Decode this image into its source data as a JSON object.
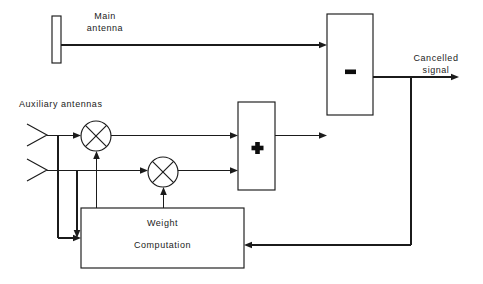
{
  "diagram": {
    "stroke_color": "#1b1b1b",
    "background_color": "#ffffff",
    "labels": {
      "main_antenna_line1": "Main",
      "main_antenna_line2": "antenna",
      "auxiliary_antennas": "Auxiliary antennas",
      "cancelled_signal_line1": "Cancelled",
      "cancelled_signal_line2": "signal",
      "weight_line1": "Weight",
      "weight_line2": "Computation"
    },
    "blocks": [
      {
        "id": "main-antenna",
        "name": "main-antenna-element",
        "shape": "rect",
        "x": 52,
        "y": 16,
        "width": 9,
        "height": 47,
        "symbol": ""
      },
      {
        "id": "subtractor",
        "name": "subtractor-block",
        "shape": "rect",
        "x": 327,
        "y": 14,
        "width": 46,
        "height": 101,
        "symbol": "−"
      },
      {
        "id": "summer",
        "name": "summer-block",
        "shape": "rect",
        "x": 238,
        "y": 102,
        "width": 37,
        "height": 88,
        "symbol": "+"
      },
      {
        "id": "weight-computation",
        "name": "weight-computation-block",
        "shape": "rect",
        "x": 81,
        "y": 208,
        "width": 163,
        "height": 60,
        "symbol": ""
      }
    ],
    "mixers": [
      {
        "id": "mixer-1",
        "name": "mixer-upper",
        "cx": 96,
        "cy": 136,
        "r": 15
      },
      {
        "id": "mixer-2",
        "name": "mixer-lower",
        "cx": 163,
        "cy": 172,
        "r": 15
      }
    ],
    "antennas": [
      {
        "id": "aux-antenna-1",
        "name": "auxiliary-antenna-upper",
        "tip_x": 47,
        "tip_y": 135,
        "back_x": 27,
        "spread": 11
      },
      {
        "id": "aux-antenna-2",
        "name": "auxiliary-antenna-lower",
        "tip_x": 47,
        "tip_y": 170,
        "back_x": 27,
        "spread": 11
      }
    ],
    "signals": [
      {
        "id": "main-feed",
        "name": "main-antenna-signal-path",
        "from": "main-antenna",
        "to": "subtractor"
      },
      {
        "id": "aux1-feed",
        "name": "auxiliary-1-signal-path",
        "from": "aux-antenna-1",
        "to": "mixer-1"
      },
      {
        "id": "aux2-feed",
        "name": "auxiliary-2-signal-path",
        "from": "aux-antenna-2",
        "to": "mixer-2"
      },
      {
        "id": "mixer1-out",
        "name": "mixer-1-output-path",
        "from": "mixer-1",
        "to": "summer"
      },
      {
        "id": "mixer2-out",
        "name": "mixer-2-output-path",
        "from": "mixer-2",
        "to": "summer"
      },
      {
        "id": "summer-out",
        "name": "summer-output-path",
        "from": "summer",
        "to": "subtractor"
      },
      {
        "id": "weight1",
        "name": "weight-1-control-path",
        "from": "weight-computation",
        "to": "mixer-1"
      },
      {
        "id": "weight2",
        "name": "weight-2-control-path",
        "from": "weight-computation",
        "to": "mixer-2"
      },
      {
        "id": "aux1-tap",
        "name": "auxiliary-1-tap-to-weight-path",
        "from": "aux-antenna-1",
        "to": "weight-computation"
      },
      {
        "id": "aux2-tap",
        "name": "auxiliary-2-tap-to-weight-path",
        "from": "aux-antenna-2",
        "to": "weight-computation"
      },
      {
        "id": "error-feedback",
        "name": "error-feedback-path",
        "from": "subtractor",
        "to": "weight-computation"
      },
      {
        "id": "output",
        "name": "cancelled-signal-output-path",
        "from": "subtractor",
        "to": "cancelled-signal"
      }
    ]
  }
}
